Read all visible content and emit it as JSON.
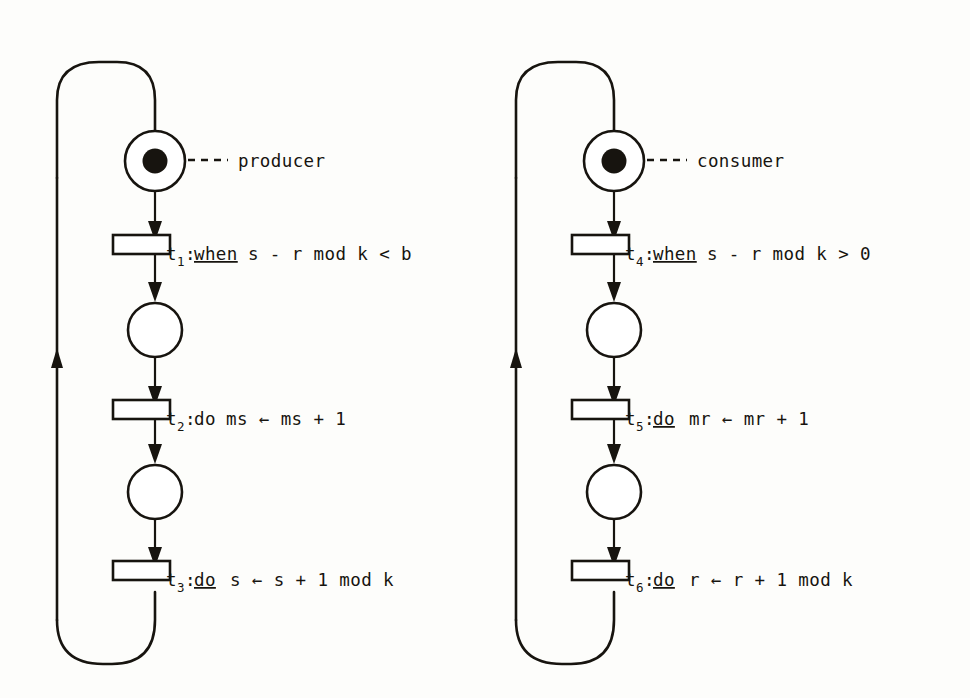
{
  "figure": {
    "kind": "petri-net-diagram",
    "background_color": "#fdfdfb",
    "ink_color": "#17140f"
  },
  "nets": [
    {
      "id": "producer",
      "annotation_label": "producer",
      "annotation_leader": "---",
      "places": [
        {
          "id": "p-producer-idle",
          "marked": true,
          "tokens": 1
        },
        {
          "id": "p-producer-mid1",
          "marked": false,
          "tokens": 0
        },
        {
          "id": "p-producer-mid2",
          "marked": false,
          "tokens": 0
        }
      ],
      "transitions": [
        {
          "id": "t1",
          "name": "t",
          "subscript": "1",
          "separator": ":",
          "keyword": "when",
          "keyword_underlined": true,
          "body": "s - r mod k < b",
          "full_label": "t1:when s - r mod k < b"
        },
        {
          "id": "t2",
          "name": "t",
          "subscript": "2",
          "separator": ":",
          "keyword": "do",
          "keyword_underlined": false,
          "body": "ms ← ms + 1",
          "full_label": "t2:do ms ← ms + 1"
        },
        {
          "id": "t3",
          "name": "t",
          "subscript": "3",
          "separator": ":",
          "keyword": "do",
          "keyword_underlined": true,
          "body": "s ← s + 1 mod k",
          "full_label": "t3:do s ← s + 1 mod k"
        }
      ]
    },
    {
      "id": "consumer",
      "annotation_label": "consumer",
      "annotation_leader": "---",
      "places": [
        {
          "id": "p-consumer-idle",
          "marked": true,
          "tokens": 1
        },
        {
          "id": "p-consumer-mid1",
          "marked": false,
          "tokens": 0
        },
        {
          "id": "p-consumer-mid2",
          "marked": false,
          "tokens": 0
        }
      ],
      "transitions": [
        {
          "id": "t4",
          "name": "t",
          "subscript": "4",
          "separator": ":",
          "keyword": "when",
          "keyword_underlined": true,
          "body": "s - r mod k > 0",
          "full_label": "t4:when s - r mod k > 0"
        },
        {
          "id": "t5",
          "name": "t",
          "subscript": "5",
          "separator": ":",
          "keyword": "do",
          "keyword_underlined": true,
          "body": "mr ← mr + 1",
          "full_label": "t5:do mr ← mr + 1"
        },
        {
          "id": "t6",
          "name": "t",
          "subscript": "6",
          "separator": ":",
          "keyword": "do",
          "keyword_underlined": true,
          "body": "r ← r + 1 mod k",
          "full_label": "t6:do r ← r + 1 mod k"
        }
      ]
    }
  ]
}
